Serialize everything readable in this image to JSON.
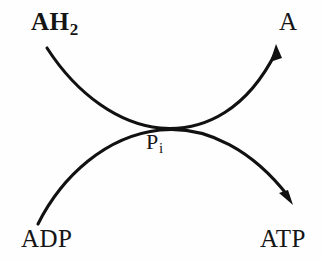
{
  "figure": {
    "name": "coupled-reaction-diagram",
    "background_color": "#fefefe",
    "stroke_color": "#111111"
  },
  "labels": {
    "substrate_top_left": {
      "text": "AH",
      "subscript": "2",
      "name": "reduced-substrate-label"
    },
    "product_top_right": {
      "text": "A",
      "name": "oxidized-product-label"
    },
    "substrate_bottom_left": {
      "text": "ADP",
      "name": "adp-label"
    },
    "product_bottom_right": {
      "text": "ATP",
      "name": "atp-label"
    },
    "cofactor_center": {
      "text": "P",
      "subscript": "i",
      "name": "inorganic-phosphate-label"
    }
  },
  "arrows": {
    "oxidation_arrow": {
      "from": "AH2",
      "to": "A",
      "name": "oxidation-curve",
      "path": "M 47 48 C 78 96 120 124 160 128 C 206 132 248 108 276 52",
      "head_points": "276,44 270,62 282,58"
    },
    "phosphorylation_arrow": {
      "from": "ADP",
      "to": "ATP",
      "name": "phosphorylation-curve",
      "path": "M 38 224 C 62 176 106 136 160 130 C 208 125 254 152 288 196",
      "head_points": "293,205 279,193 288,190"
    }
  }
}
